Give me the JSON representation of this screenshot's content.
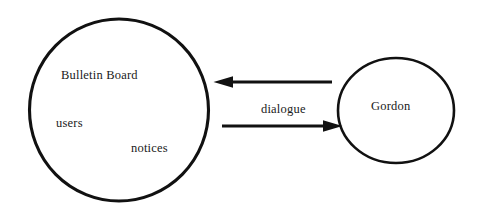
{
  "diagram": {
    "type": "collaboration-diagram",
    "background_color": "#ffffff",
    "stroke_color": "#111111",
    "text_color": "#1a1a1a",
    "nodes": [
      {
        "id": "bulletin-board",
        "shape": "circle",
        "label": "Bulletin Board",
        "inner_labels": [
          "users",
          "notices"
        ],
        "center": {
          "x": 119,
          "y": 110
        },
        "radius_x": 90,
        "radius_y": 91,
        "stroke_width": 3
      },
      {
        "id": "gordon",
        "shape": "circle",
        "label": "Gordon",
        "inner_labels": [],
        "center": {
          "x": 396,
          "y": 110
        },
        "radius_x": 58,
        "radius_y": 52,
        "stroke_width": 2.6
      }
    ],
    "labels": {
      "bulletin_board": "Bulletin Board",
      "users": "users",
      "notices": "notices",
      "gordon": "Gordon",
      "dialogue": "dialogue"
    },
    "edges": [
      {
        "id": "gordon-to-bulletin-board",
        "label": "",
        "direction": "left",
        "from": "gordon",
        "to": "bulletin-board",
        "start": {
          "x": 332,
          "y": 82
        },
        "end": {
          "x": 214,
          "y": 82
        },
        "line_width": 3,
        "arrowhead": "solid-triangle"
      },
      {
        "id": "bulletin-board-to-gordon",
        "label": "dialogue",
        "direction": "right",
        "from": "bulletin-board",
        "to": "gordon",
        "start": {
          "x": 222,
          "y": 126
        },
        "end": {
          "x": 342,
          "y": 126
        },
        "line_width": 3,
        "arrowhead": "solid-triangle"
      }
    ]
  }
}
